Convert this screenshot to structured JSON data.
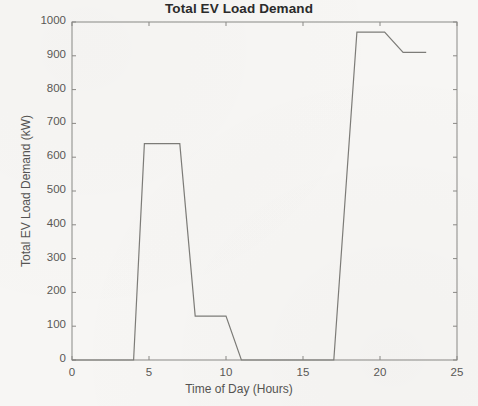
{
  "chart_data": {
    "type": "line",
    "title": "Total EV Load Demand",
    "xlabel": "Time of Day (Hours)",
    "ylabel": "Total EV Load Demand (kW)",
    "xlim": [
      0,
      25
    ],
    "ylim": [
      0,
      1000
    ],
    "xticks": [
      0,
      5,
      10,
      15,
      20,
      25
    ],
    "yticks": [
      0,
      100,
      200,
      300,
      400,
      500,
      600,
      700,
      800,
      900,
      1000
    ],
    "xtick_labels": [
      "0",
      "5",
      "10",
      "15",
      "20",
      "25"
    ],
    "ytick_labels": [
      "0",
      "100",
      "200",
      "300",
      "400",
      "500",
      "600",
      "700",
      "800",
      "900",
      "1000"
    ],
    "grid": false,
    "legend": null,
    "legend_position": "none",
    "line_color": "#7d7c78",
    "line_width": 1.2,
    "series": [
      {
        "name": "Total EV Load Demand",
        "x": [
          0,
          4,
          4.7,
          7,
          8,
          10,
          11,
          17,
          18.5,
          20.3,
          21.5,
          23
        ],
        "y": [
          0,
          0,
          640,
          640,
          130,
          130,
          0,
          0,
          970,
          970,
          910,
          910
        ]
      }
    ]
  },
  "figure": {
    "background_color": "#f7f6f4",
    "axes_color": "#8a8986"
  }
}
